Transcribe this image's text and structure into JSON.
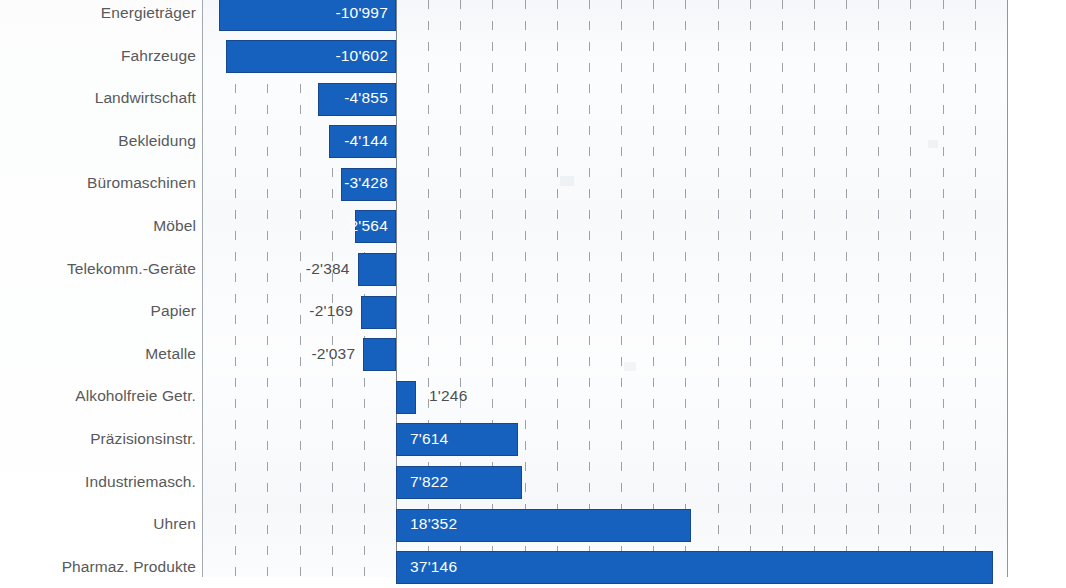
{
  "chart_data": {
    "type": "bar",
    "orientation": "horizontal",
    "title": "",
    "subtitle": "",
    "xlabel": "",
    "ylabel": "",
    "xlim": [
      -12000,
      38500
    ],
    "grid": true,
    "grid_step": 2000,
    "legend": "none",
    "zero_axis": true,
    "thousands_separator": "'",
    "bar_color": "#1561bd",
    "bar_border_color": "#17478e",
    "label_color": "#58595b",
    "gridline_color": "#8d9298",
    "categories": [
      "Energieträger",
      "Fahrzeuge",
      "Landwirtschaft",
      "Bekleidung",
      "Büromaschinen",
      "Möbel",
      "Telekomm.-Geräte",
      "Papier",
      "Metalle",
      "Alkoholfreie Getr.",
      "Präzisionsinstr.",
      "Industriemasch.",
      "Uhren",
      "Pharmaz. Produkte"
    ],
    "values": [
      -10997,
      -10602,
      -4855,
      -4144,
      -3428,
      -2564,
      -2384,
      -2169,
      -2037,
      1246,
      7614,
      7822,
      18352,
      37146
    ],
    "value_labels": [
      "-10'997",
      "-10'602",
      "-4'855",
      "-4'144",
      "-3'428",
      "2'564",
      "-2'384",
      "-2'169",
      "-2'037",
      "1'246",
      "7'614",
      "7'822",
      "18'352",
      "37'146"
    ],
    "label_placement": [
      "inside",
      "inside",
      "inside",
      "inside",
      "inside",
      "inside",
      "outside",
      "outside",
      "outside",
      "outside",
      "inside",
      "inside",
      "inside",
      "inside"
    ],
    "cropped_top": true,
    "cropped_bottom": true
  },
  "rows": [
    {
      "label": "Energieträger",
      "value": -10997,
      "text": "-10'997",
      "place": "inside"
    },
    {
      "label": "Fahrzeuge",
      "value": -10602,
      "text": "-10'602",
      "place": "inside"
    },
    {
      "label": "Landwirtschaft",
      "value": -4855,
      "text": "-4'855",
      "place": "inside"
    },
    {
      "label": "Bekleidung",
      "value": -4144,
      "text": "-4'144",
      "place": "inside"
    },
    {
      "label": "Büromaschinen",
      "value": -3428,
      "text": "-3'428",
      "place": "inside"
    },
    {
      "label": "Möbel",
      "value": -2564,
      "text": "2'564",
      "place": "inside"
    },
    {
      "label": "Telekomm.-Geräte",
      "value": -2384,
      "text": "-2'384",
      "place": "outside"
    },
    {
      "label": "Papier",
      "value": -2169,
      "text": "-2'169",
      "place": "outside"
    },
    {
      "label": "Metalle",
      "value": -2037,
      "text": "-2'037",
      "place": "outside"
    },
    {
      "label": "Alkoholfreie Getr.",
      "value": 1246,
      "text": "1'246",
      "place": "outside"
    },
    {
      "label": "Präzisionsinstr.",
      "value": 7614,
      "text": "7'614",
      "place": "inside"
    },
    {
      "label": "Industriemasch.",
      "value": 7822,
      "text": "7'822",
      "place": "inside"
    },
    {
      "label": "Uhren",
      "value": 18352,
      "text": "18'352",
      "place": "inside"
    },
    {
      "label": "Pharmaz. Produkte",
      "value": 37146,
      "text": "37'146",
      "place": "inside"
    }
  ]
}
